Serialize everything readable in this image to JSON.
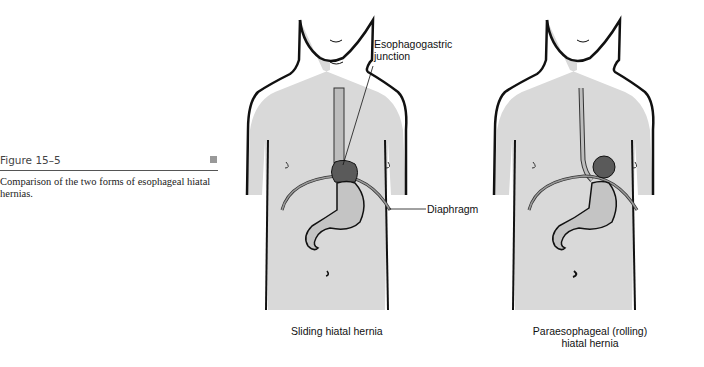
{
  "caption": {
    "figure_number": "Figure 15–5",
    "text": "Comparison of the two forms of esophageal hiatal hernias."
  },
  "figures": [
    {
      "title": "Sliding hiatal hernia",
      "labels": {
        "junction_line1": "Esophagogastric",
        "junction_line2": "junction",
        "diaphragm": "Diaphragm"
      }
    },
    {
      "title_line1": "Paraesophageal (rolling)",
      "title_line2": "hiatal hernia"
    }
  ],
  "colors": {
    "skin": "#d9d9d9",
    "stomach": "#c4c4c4",
    "hernia": "#5a5a5a",
    "outline": "#111111"
  }
}
